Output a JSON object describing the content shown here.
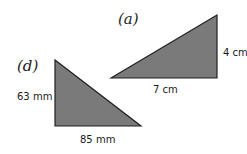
{
  "colors": {
    "fill": "#7a7a7a",
    "stroke": "#1f1f1f",
    "background": "#ffffff"
  },
  "triangles": [
    {
      "id": "a",
      "label": "(a)",
      "base": "7 cm",
      "height": "4 cm",
      "points": "111,78 217,15 217,78"
    },
    {
      "id": "d",
      "label": "(d)",
      "base": "85 mm",
      "height": "63 mm",
      "points": "55,60 55,126 141,126"
    }
  ]
}
